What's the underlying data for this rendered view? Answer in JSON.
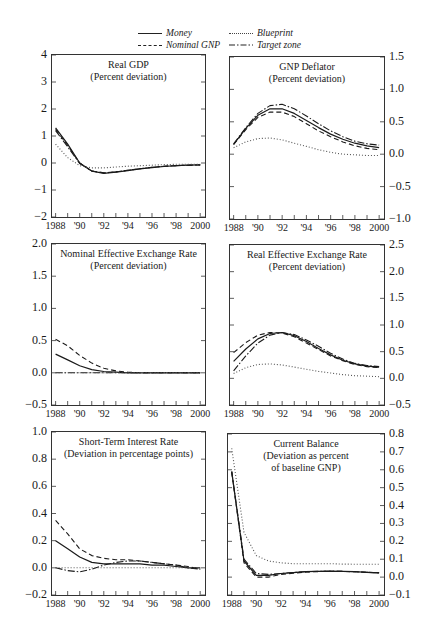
{
  "legend": {
    "items": [
      {
        "label": "Money",
        "style": "solid"
      },
      {
        "label": "Blueprint",
        "style": "dotted"
      },
      {
        "label": "Nominal GNP",
        "style": "dashed"
      },
      {
        "label": "Target zone",
        "style": "dashdot"
      }
    ]
  },
  "chart_data": [
    {
      "type": "line",
      "title": "Real GDP",
      "subtitle": "(Percent deviation)",
      "yaxis_side": "left",
      "ylim": [
        -2,
        4
      ],
      "yticks": [
        "4",
        "3",
        "2",
        "1",
        "0",
        "−1",
        "−2"
      ],
      "xticks": [
        "1988",
        "'90",
        "'92",
        "'94",
        "'96",
        "'98",
        "2000"
      ],
      "x": [
        1988,
        1989,
        1990,
        1991,
        1992,
        1993,
        1994,
        1995,
        1996,
        1997,
        1998,
        1999,
        2000
      ],
      "series": [
        {
          "name": "Money",
          "values": [
            1.3,
            0.7,
            0.0,
            -0.3,
            -0.38,
            -0.34,
            -0.28,
            -0.22,
            -0.17,
            -0.13,
            -0.1,
            -0.08,
            -0.07
          ]
        },
        {
          "name": "Nominal GNP",
          "values": [
            1.25,
            0.65,
            0.0,
            -0.3,
            -0.36,
            -0.33,
            -0.27,
            -0.21,
            -0.16,
            -0.12,
            -0.1,
            -0.08,
            -0.07
          ]
        },
        {
          "name": "Target zone",
          "values": [
            1.2,
            0.6,
            -0.02,
            -0.3,
            -0.37,
            -0.33,
            -0.27,
            -0.21,
            -0.16,
            -0.12,
            -0.1,
            -0.08,
            -0.07
          ]
        },
        {
          "name": "Blueprint",
          "values": [
            0.7,
            0.2,
            -0.1,
            -0.18,
            -0.18,
            -0.15,
            -0.12,
            -0.1,
            -0.08,
            -0.06,
            -0.05,
            -0.05,
            -0.05
          ]
        }
      ]
    },
    {
      "type": "line",
      "title": "GNP Deflator",
      "subtitle": "(Percent deviation)",
      "yaxis_side": "right",
      "ylim": [
        -1.0,
        1.5
      ],
      "yticks": [
        "1.5",
        "1.0",
        "0.5",
        "0.0",
        "−0.5",
        "−1.0"
      ],
      "xticks": [
        "1988",
        "'90",
        "'92",
        "'94",
        "'96",
        "'98",
        "2000"
      ],
      "x": [
        1988,
        1989,
        1990,
        1991,
        1992,
        1993,
        1994,
        1995,
        1996,
        1997,
        1998,
        1999,
        2000
      ],
      "series": [
        {
          "name": "Money",
          "values": [
            0.15,
            0.4,
            0.6,
            0.7,
            0.7,
            0.63,
            0.52,
            0.41,
            0.31,
            0.23,
            0.17,
            0.13,
            0.1
          ]
        },
        {
          "name": "Nominal GNP",
          "values": [
            0.15,
            0.38,
            0.57,
            0.65,
            0.65,
            0.58,
            0.47,
            0.36,
            0.27,
            0.19,
            0.13,
            0.09,
            0.07
          ]
        },
        {
          "name": "Target zone",
          "values": [
            0.16,
            0.41,
            0.63,
            0.75,
            0.77,
            0.7,
            0.59,
            0.47,
            0.36,
            0.27,
            0.2,
            0.16,
            0.14
          ]
        },
        {
          "name": "Blueprint",
          "values": [
            0.1,
            0.19,
            0.24,
            0.25,
            0.22,
            0.17,
            0.12,
            0.07,
            0.03,
            0.0,
            -0.01,
            -0.02,
            -0.02
          ]
        }
      ]
    },
    {
      "type": "line",
      "title": "Nominal Effective Exchange Rate",
      "subtitle": "(Percent deviation)",
      "yaxis_side": "left",
      "ylim": [
        -0.5,
        2.0
      ],
      "yticks": [
        "2.0",
        "1.5",
        "1.0",
        "0.5",
        "0.0",
        "−0.5"
      ],
      "xticks": [
        "1988",
        "'90",
        "'92",
        "'94",
        "'96",
        "'98",
        "2000"
      ],
      "x": [
        1988,
        1989,
        1990,
        1991,
        1992,
        1993,
        1994,
        1995,
        1996,
        1997,
        1998,
        1999,
        2000
      ],
      "series": [
        {
          "name": "Money",
          "values": [
            0.29,
            0.2,
            0.11,
            0.05,
            0.02,
            0.01,
            0.0,
            0.0,
            0.0,
            0.0,
            0.0,
            0.0,
            0.0
          ]
        },
        {
          "name": "Nominal GNP",
          "values": [
            0.52,
            0.42,
            0.27,
            0.15,
            0.07,
            0.03,
            0.01,
            0.0,
            0.0,
            0.0,
            0.0,
            0.0,
            0.0
          ]
        },
        {
          "name": "Target zone",
          "values": [
            0.0,
            0.0,
            0.0,
            0.0,
            0.0,
            0.0,
            0.0,
            0.0,
            0.0,
            0.0,
            0.0,
            0.0,
            0.0
          ]
        },
        {
          "name": "Blueprint",
          "values": [
            0.0,
            0.0,
            0.0,
            0.0,
            0.0,
            0.0,
            0.0,
            0.0,
            0.0,
            0.0,
            0.0,
            0.0,
            0.0
          ]
        }
      ]
    },
    {
      "type": "line",
      "title": "Real Effective Exchange Rate",
      "subtitle": "(Percent deviation)",
      "yaxis_side": "right",
      "ylim": [
        -0.5,
        2.5
      ],
      "yticks": [
        "2.5",
        "2.0",
        "1.5",
        "1.0",
        "0.5",
        "0.0",
        "−0.5"
      ],
      "xticks": [
        "1988",
        "'90",
        "'92",
        "'94",
        "'96",
        "'98",
        "2000"
      ],
      "x": [
        1988,
        1989,
        1990,
        1991,
        1992,
        1993,
        1994,
        1995,
        1996,
        1997,
        1998,
        1999,
        2000
      ],
      "series": [
        {
          "name": "Money",
          "values": [
            0.32,
            0.55,
            0.74,
            0.84,
            0.86,
            0.8,
            0.69,
            0.56,
            0.44,
            0.34,
            0.27,
            0.23,
            0.21
          ]
        },
        {
          "name": "Nominal GNP",
          "values": [
            0.48,
            0.67,
            0.81,
            0.86,
            0.85,
            0.78,
            0.66,
            0.54,
            0.42,
            0.33,
            0.26,
            0.22,
            0.2
          ]
        },
        {
          "name": "Target zone",
          "values": [
            0.14,
            0.42,
            0.66,
            0.81,
            0.86,
            0.82,
            0.72,
            0.6,
            0.47,
            0.36,
            0.28,
            0.24,
            0.22
          ]
        },
        {
          "name": "Blueprint",
          "values": [
            0.09,
            0.2,
            0.26,
            0.27,
            0.25,
            0.21,
            0.17,
            0.13,
            0.1,
            0.07,
            0.05,
            0.04,
            0.03
          ]
        }
      ]
    },
    {
      "type": "line",
      "title": "Short-Term Interest Rate",
      "subtitle": "(Deviation in percentage points)",
      "yaxis_side": "left",
      "ylim": [
        -0.2,
        1.0
      ],
      "yticks": [
        "1.0",
        "0.8",
        "0.6",
        "0.4",
        "0.2",
        "0.0",
        "−0.2"
      ],
      "xticks": [
        "1988",
        "'90",
        "'92",
        "'94",
        "'96",
        "'98",
        "2000"
      ],
      "x": [
        1988,
        1989,
        1990,
        1991,
        1992,
        1993,
        1994,
        1995,
        1996,
        1997,
        1998,
        1999,
        2000
      ],
      "series": [
        {
          "name": "Money",
          "values": [
            0.2,
            0.14,
            0.08,
            0.04,
            0.03,
            0.03,
            0.03,
            0.03,
            0.02,
            0.02,
            0.01,
            0.0,
            0.0
          ]
        },
        {
          "name": "Nominal GNP",
          "values": [
            0.35,
            0.25,
            0.14,
            0.09,
            0.07,
            0.06,
            0.06,
            0.05,
            0.04,
            0.03,
            0.02,
            0.01,
            -0.01
          ]
        },
        {
          "name": "Target zone",
          "values": [
            0.0,
            -0.02,
            -0.03,
            -0.01,
            0.02,
            0.04,
            0.05,
            0.05,
            0.04,
            0.03,
            0.02,
            0.0,
            -0.01
          ]
        },
        {
          "name": "Blueprint",
          "values": [
            0.0,
            0.0,
            0.0,
            0.0,
            0.0,
            0.0,
            0.0,
            0.0,
            0.0,
            0.0,
            0.0,
            0.0,
            0.0
          ]
        }
      ]
    },
    {
      "type": "line",
      "title": "Current Balance",
      "subtitle": "(Deviation as percent of baseline GNP)",
      "subtitle_lines": [
        "(Deviation as percent",
        "of baseline GNP)"
      ],
      "yaxis_side": "right",
      "ylim": [
        -0.1,
        0.8
      ],
      "yticks": [
        "0.8",
        "0.7",
        "0.6",
        "0.5",
        "0.4",
        "0.3",
        "0.2",
        "0.1",
        "0.0",
        "−0.1"
      ],
      "xticks": [
        "1988",
        "'90",
        "'92",
        "'94",
        "'96",
        "'98",
        "2000"
      ],
      "x": [
        1988,
        1989,
        1990,
        1991,
        1992,
        1993,
        1994,
        1995,
        1996,
        1997,
        1998,
        1999,
        2000
      ],
      "series": [
        {
          "name": "Money",
          "values": [
            0.59,
            0.09,
            0.01,
            0.01,
            0.02,
            0.025,
            0.03,
            0.032,
            0.033,
            0.032,
            0.03,
            0.027,
            0.024
          ]
        },
        {
          "name": "Nominal GNP",
          "values": [
            0.59,
            0.08,
            0.0,
            0.0,
            0.015,
            0.022,
            0.028,
            0.031,
            0.033,
            0.032,
            0.03,
            0.027,
            0.024
          ]
        },
        {
          "name": "Target zone",
          "values": [
            0.59,
            0.1,
            0.02,
            0.015,
            0.02,
            0.026,
            0.03,
            0.032,
            0.033,
            0.032,
            0.03,
            0.027,
            0.024
          ]
        },
        {
          "name": "Blueprint",
          "values": [
            0.72,
            0.25,
            0.12,
            0.09,
            0.08,
            0.075,
            0.075,
            0.075,
            0.075,
            0.073,
            0.072,
            0.072,
            0.072
          ]
        }
      ]
    }
  ],
  "panels_layout": [
    {
      "left": 51,
      "top": 54,
      "width": 155,
      "height": 164
    },
    {
      "left": 229,
      "top": 56,
      "width": 156,
      "height": 164
    },
    {
      "left": 51,
      "top": 243,
      "width": 155,
      "height": 163
    },
    {
      "left": 229,
      "top": 244,
      "width": 156,
      "height": 162
    },
    {
      "left": 51,
      "top": 431,
      "width": 155,
      "height": 165
    },
    {
      "left": 227,
      "top": 433,
      "width": 158,
      "height": 163
    }
  ]
}
